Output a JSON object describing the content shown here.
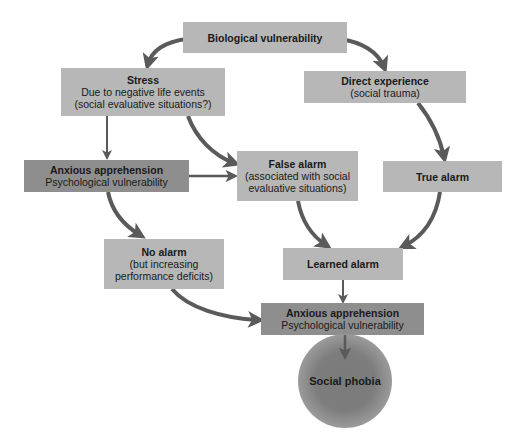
{
  "diagram": {
    "type": "flowchart",
    "nodes": {
      "biological": {
        "title": "Biological vulnerability"
      },
      "stress": {
        "title": "Stress",
        "lines": [
          "Due to negative life events",
          "(social evaluative situations?)"
        ]
      },
      "direct": {
        "title": "Direct experience",
        "lines": [
          "(social trauma)"
        ]
      },
      "anxious_left": {
        "title": "Anxious apprehension",
        "lines": [
          "Psychological vulnerability"
        ]
      },
      "false_alarm": {
        "title": "False alarm",
        "lines": [
          "(associated with social",
          "evaluative situations)"
        ]
      },
      "true_alarm": {
        "title": "True alarm"
      },
      "no_alarm": {
        "title": "No alarm",
        "lines": [
          "(but increasing",
          "performance deficits)"
        ]
      },
      "learned_alarm": {
        "title": "Learned alarm"
      },
      "anxious_bottom": {
        "title": "Anxious apprehension",
        "lines": [
          "Psychological vulnerability"
        ]
      },
      "social_phobia": {
        "title": "Social phobia"
      }
    },
    "edges": [
      [
        "Biological vulnerability",
        "Stress"
      ],
      [
        "Biological vulnerability",
        "Direct experience"
      ],
      [
        "Stress",
        "Anxious apprehension (left)"
      ],
      [
        "Stress",
        "False alarm"
      ],
      [
        "Anxious apprehension (left)",
        "False alarm"
      ],
      [
        "Anxious apprehension (left)",
        "No alarm"
      ],
      [
        "Direct experience",
        "True alarm"
      ],
      [
        "False alarm",
        "Learned alarm"
      ],
      [
        "True alarm",
        "Learned alarm"
      ],
      [
        "No alarm",
        "Anxious apprehension (bottom)"
      ],
      [
        "Learned alarm",
        "Anxious apprehension (bottom)"
      ],
      [
        "Anxious apprehension (bottom)",
        "Social phobia"
      ]
    ],
    "colors": {
      "light_box": "#b7b7b7",
      "dark_box": "#8e8e8e",
      "arrow": "#5a5a5a",
      "circle": "#7d7d7d"
    }
  }
}
